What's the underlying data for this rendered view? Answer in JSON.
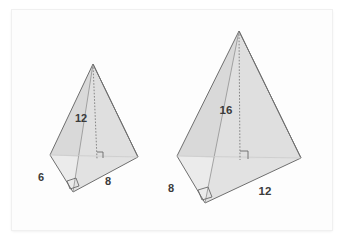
{
  "figure": {
    "background_color": "#ffffff",
    "panel_color": "#fdfdfd",
    "edge_color": "#6e6e6e",
    "face_colors": {
      "right_face_dark": "#b9b9b9",
      "left_face_light": "#d6d6d6",
      "front_face_pale": "#e3e3e3",
      "base_white": "#ffffff"
    }
  },
  "pyramid_left": {
    "name": "small-pyramid",
    "labels": {
      "height": "12",
      "base_left": "6",
      "base_right": "8"
    },
    "vertices": {
      "apex": [
        93,
        64
      ],
      "base_back_left": [
        50,
        155
      ],
      "base_front": [
        73,
        192
      ],
      "base_right": [
        138,
        157
      ]
    },
    "altitude_foot": [
      97,
      158
    ],
    "right_angle_markers": 2
  },
  "pyramid_right": {
    "name": "large-pyramid",
    "labels": {
      "height": "16",
      "base_left": "8",
      "base_right": "12"
    },
    "vertices": {
      "apex": [
        239,
        31
      ],
      "base_back_left": [
        177,
        156
      ],
      "base_front": [
        205,
        203
      ],
      "base_right": [
        301,
        158
      ]
    },
    "altitude_foot": [
      240,
      159
    ],
    "right_angle_markers": 2
  },
  "label_positions": {
    "left_height": [
      81,
      122
    ],
    "left_base_left": [
      40,
      180
    ],
    "left_base_right": [
      107,
      184
    ],
    "right_height": [
      219,
      113
    ],
    "right_base_left": [
      169,
      191
    ],
    "right_base_right": [
      259,
      194
    ]
  }
}
